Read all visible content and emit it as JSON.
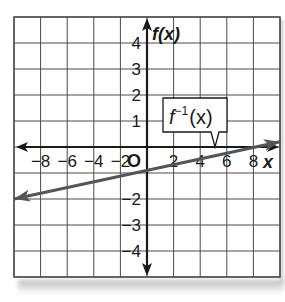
{
  "chart_data": {
    "type": "line",
    "title": "",
    "xlabel": "x",
    "ylabel": "f(x)",
    "origin_label": "O",
    "xlim": [
      -10,
      10
    ],
    "ylim": [
      -5,
      5
    ],
    "x_ticks": [
      -8,
      -6,
      -4,
      -2,
      2,
      4,
      6,
      8
    ],
    "x_tick_labels": [
      "−8",
      "−6",
      "−4",
      "−2",
      "2",
      "4",
      "6",
      "8"
    ],
    "y_ticks": [
      -4,
      -3,
      -2,
      1,
      2,
      3,
      4
    ],
    "y_tick_labels": [
      "−4",
      "−3",
      "−2",
      "1",
      "2",
      "3",
      "4"
    ],
    "grid": true,
    "grid_x_step": 2,
    "grid_y_step": 1,
    "series": [
      {
        "name": "f⁻¹(x)",
        "x": [
          -10,
          0,
          8,
          10
        ],
        "y": [
          -2.0,
          -0.8,
          0,
          0.2
        ],
        "arrows_both_ends": true,
        "color": "#555555"
      }
    ],
    "annotations": [
      {
        "text": "f⁻¹(x)",
        "type": "callout",
        "points_to": [
          5,
          0
        ]
      }
    ]
  },
  "labels": {
    "y_axis": "f(x)",
    "x_axis": "x",
    "origin": "O",
    "callout_f": "f",
    "callout_sup": "−1",
    "callout_arg": "(x)"
  },
  "colors": {
    "grid": "#4a4a4a",
    "axis": "#1a1a1a",
    "line": "#555555",
    "background": "#ffffff"
  }
}
